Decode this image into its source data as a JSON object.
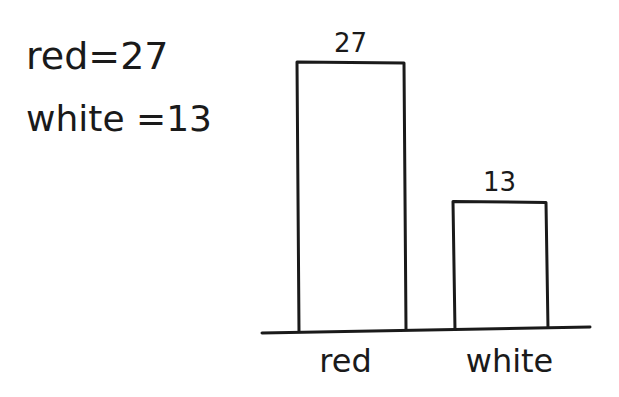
{
  "notes": [
    {
      "text": "red=27"
    },
    {
      "text": "white =13"
    }
  ],
  "chart_data": {
    "type": "bar",
    "title": "",
    "xlabel": "",
    "ylabel": "",
    "categories": [
      "red",
      "white"
    ],
    "values": [
      27,
      13
    ],
    "data_labels": [
      "27",
      "13"
    ],
    "ylim": [
      0,
      27
    ],
    "grid": false,
    "legend": "none",
    "style": "hand-drawn outline bars"
  }
}
